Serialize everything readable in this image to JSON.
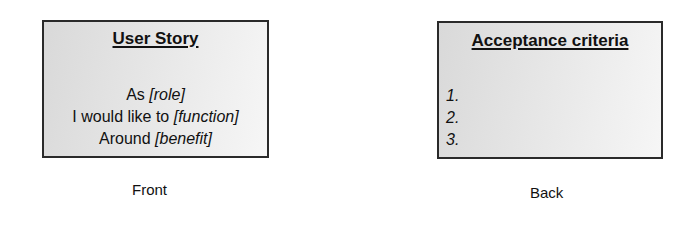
{
  "front": {
    "title": "User Story",
    "lines": [
      {
        "prefix": "As ",
        "placeholder": "[role]"
      },
      {
        "prefix": "I would like to ",
        "placeholder": "[function]"
      },
      {
        "prefix": "Around ",
        "placeholder": "[benefit]"
      }
    ],
    "caption": "Front"
  },
  "back": {
    "title": "Acceptance criteria",
    "items": [
      "1.",
      "2.",
      "3."
    ],
    "caption": "Back"
  }
}
